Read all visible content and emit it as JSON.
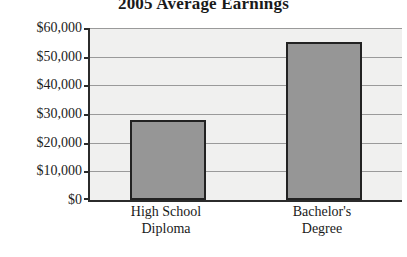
{
  "chart_data": {
    "type": "bar",
    "title": "2005 Average Earnings",
    "xlabel": "",
    "ylabel": "",
    "categories": [
      "High School Diploma",
      "Bachelor's Degree"
    ],
    "category_lines": [
      [
        "High School",
        "Diploma"
      ],
      [
        "Bachelor's",
        "Degree"
      ]
    ],
    "values": [
      28000,
      55000
    ],
    "ylim": [
      0,
      60000
    ],
    "ytick_values": [
      0,
      10000,
      20000,
      30000,
      40000,
      50000,
      60000
    ],
    "ytick_labels": [
      "$0",
      "$10,000",
      "$20,000",
      "$30,000",
      "$40,000",
      "$50,000",
      "$60,000"
    ],
    "grid": true,
    "legend": null,
    "colors": {
      "bar_fill": "#969696",
      "bar_border": "#222222",
      "plot_background": "#f0f0ef",
      "gridline": "#9a9a9a",
      "axis": "#2b2b2b",
      "text": "#1a1a1a"
    }
  }
}
